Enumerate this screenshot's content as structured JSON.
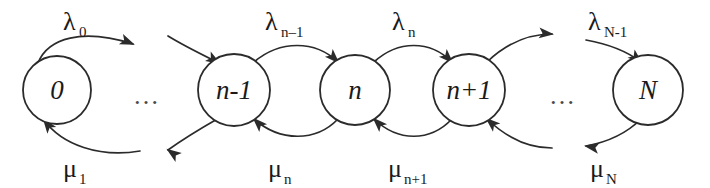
{
  "figure": {
    "kind": "state-transition-diagram",
    "background_color": "#ffffff",
    "stroke_color": "#2b2b2b",
    "text_color": "#1a1a1a"
  },
  "states": [
    {
      "id": "state-0",
      "label": "0",
      "cx": 57,
      "cy": 90,
      "r": 34
    },
    {
      "id": "state-n-1",
      "label": "n-1",
      "cx": 234,
      "cy": 90,
      "r": 36
    },
    {
      "id": "state-n",
      "label": "n",
      "cx": 355,
      "cy": 90,
      "r": 35
    },
    {
      "id": "state-n+1",
      "label": "n+1",
      "cx": 469,
      "cy": 90,
      "r": 36
    },
    {
      "id": "state-N",
      "label": "N",
      "cx": 648,
      "cy": 90,
      "r": 35
    }
  ],
  "ellipses": [
    {
      "id": "ellipsis-left",
      "label": "…",
      "x": 133,
      "y": 104
    },
    {
      "id": "ellipsis-right",
      "label": "…",
      "x": 549,
      "y": 104
    }
  ],
  "birth_rates": [
    {
      "id": "lambda-0",
      "base": "λ",
      "sub": "0",
      "x": 63,
      "y": 30
    },
    {
      "id": "lambda-n-1",
      "base": "λ",
      "sub": "n–1",
      "x": 265,
      "y": 30
    },
    {
      "id": "lambda-n",
      "base": "λ",
      "sub": "n",
      "x": 392,
      "y": 30
    },
    {
      "id": "lambda-N-1",
      "base": "λ",
      "sub": "N-1",
      "x": 588,
      "y": 30
    }
  ],
  "death_rates": [
    {
      "id": "mu-1",
      "base": "μ",
      "sub": "1",
      "x": 63,
      "y": 177
    },
    {
      "id": "mu-n",
      "base": "μ",
      "sub": "n",
      "x": 268,
      "y": 177
    },
    {
      "id": "mu-n+1",
      "base": "μ",
      "sub": "n+1",
      "x": 388,
      "y": 177
    },
    {
      "id": "mu-N",
      "base": "μ",
      "sub": "N",
      "x": 590,
      "y": 177
    }
  ],
  "birth_arcs": [
    {
      "id": "arc-birth-0",
      "d": "M 38 63 C 48 38, 82 28, 133 44",
      "head": {
        "x": 133,
        "y": 44,
        "angle": 22
      }
    },
    {
      "id": "arc-birth-prev",
      "d": "M 168 36 C 186 47, 205 56, 219 63",
      "head": {
        "x": 219,
        "y": 63,
        "angle": 31
      }
    },
    {
      "id": "arc-birth-n-1",
      "d": "M 254 62 C 280 40, 315 40, 338 62",
      "head": {
        "x": 338,
        "y": 62,
        "angle": 45
      }
    },
    {
      "id": "arc-birth-n",
      "d": "M 374 62 C 398 40, 430 40, 452 62",
      "head": {
        "x": 452,
        "y": 62,
        "angle": 45
      }
    },
    {
      "id": "arc-birth-n+1",
      "d": "M 487 62 C 508 42, 530 34, 552 34",
      "head": {
        "x": 552,
        "y": 34,
        "angle": 5
      }
    },
    {
      "id": "arc-birth-N-1",
      "d": "M 586 40 C 608 44, 628 52, 641 62",
      "head": {
        "x": 641,
        "y": 62,
        "angle": 40
      }
    }
  ],
  "death_arcs": [
    {
      "id": "arc-death-1",
      "d": "M 140 151 C 100 158, 62 145, 44 120",
      "head": {
        "x": 44,
        "y": 120,
        "angle": 233
      }
    },
    {
      "id": "arc-death-next",
      "d": "M 219 118 C 205 126, 186 137, 168 150",
      "head": {
        "x": 168,
        "y": 150,
        "angle": 215
      }
    },
    {
      "id": "arc-death-n",
      "d": "M 338 119 C 316 142, 280 142, 254 119",
      "head": {
        "x": 254,
        "y": 119,
        "angle": 225
      }
    },
    {
      "id": "arc-death-n+1",
      "d": "M 452 119 C 430 142, 398 142, 374 119",
      "head": {
        "x": 374,
        "y": 119,
        "angle": 225
      }
    },
    {
      "id": "arc-death-right",
      "d": "M 552 148 C 530 148, 508 139, 487 119",
      "head": {
        "x": 487,
        "y": 119,
        "angle": 222
      }
    },
    {
      "id": "arc-death-N",
      "d": "M 641 119 C 628 132, 608 142, 586 146",
      "head": {
        "x": 586,
        "y": 146,
        "angle": 190
      }
    }
  ]
}
